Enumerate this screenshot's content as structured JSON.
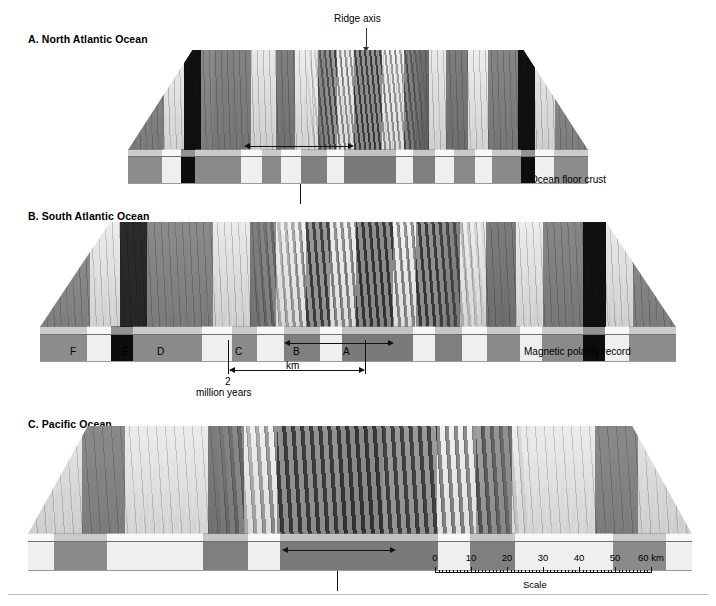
{
  "figure": {
    "ridge_axis_label": "Ridge axis",
    "ocean_floor_crust_label": "Ocean floor crust",
    "magnetic_polarity_label": "Magnetic polarity record",
    "km_label": "km",
    "million_years_number": "2",
    "million_years_label": "million years",
    "scale_caption": "Scale",
    "scale_unit_label": "60 km"
  },
  "panels": [
    {
      "id": "a",
      "title": "A. North Atlantic Ocean",
      "spreading": "slow",
      "top_stripes": [
        {
          "w": 26,
          "c": "#8a8a8a"
        },
        {
          "w": 14,
          "c": "#ececec"
        },
        {
          "w": 12,
          "c": "#111111"
        },
        {
          "w": 10,
          "c": "#8a8a8a"
        },
        {
          "w": 26,
          "c": "#838383"
        },
        {
          "w": 18,
          "c": "#e8e8e8"
        },
        {
          "w": 14,
          "c": "#7e7e7e"
        },
        {
          "w": 16,
          "c": "#ededed"
        },
        {
          "w": 14,
          "c": "#6f6f6f"
        },
        {
          "w": 12,
          "c": "#e5e5e5"
        },
        {
          "w": 20,
          "c": "#636363"
        },
        {
          "w": 16,
          "c": "#ebebeb"
        },
        {
          "w": 18,
          "c": "#6b6b6b"
        },
        {
          "w": 12,
          "c": "#e9e9e9"
        },
        {
          "w": 16,
          "c": "#7c7c7c"
        },
        {
          "w": 14,
          "c": "#ededed"
        },
        {
          "w": 22,
          "c": "#858585"
        },
        {
          "w": 12,
          "c": "#111111"
        },
        {
          "w": 14,
          "c": "#e9e9e9"
        },
        {
          "w": 24,
          "c": "#8d8d8d"
        }
      ],
      "crust_stripes": [
        {
          "w": 28,
          "c": "#8d8d8d"
        },
        {
          "w": 16,
          "c": "#efefef"
        },
        {
          "w": 12,
          "c": "#0d0d0d"
        },
        {
          "w": 38,
          "c": "#8a8a8a"
        },
        {
          "w": 18,
          "c": "#efefef"
        },
        {
          "w": 16,
          "c": "#8a8a8a"
        },
        {
          "w": 16,
          "c": "#efefef"
        },
        {
          "w": 22,
          "c": "#7f7f7f"
        },
        {
          "w": 14,
          "c": "#efefef"
        },
        {
          "w": 44,
          "c": "#7a7a7a"
        },
        {
          "w": 14,
          "c": "#efefef"
        },
        {
          "w": 18,
          "c": "#7f7f7f"
        },
        {
          "w": 16,
          "c": "#efefef"
        },
        {
          "w": 18,
          "c": "#8a8a8a"
        },
        {
          "w": 14,
          "c": "#efefef"
        },
        {
          "w": 24,
          "c": "#8a8a8a"
        },
        {
          "w": 12,
          "c": "#0d0d0d"
        },
        {
          "w": 16,
          "c": "#efefef"
        },
        {
          "w": 28,
          "c": "#8d8d8d"
        }
      ]
    },
    {
      "id": "b",
      "title": "B. South Atlantic Ocean",
      "spreading": "medium",
      "anomaly_labels": [
        "F",
        "E",
        "D",
        "C",
        "B",
        "A"
      ],
      "top_stripes": [
        {
          "w": 30,
          "c": "#909090"
        },
        {
          "w": 18,
          "c": "#ededed"
        },
        {
          "w": 16,
          "c": "#2b2b2b"
        },
        {
          "w": 40,
          "c": "#8b8b8b"
        },
        {
          "w": 22,
          "c": "#ebebeb"
        },
        {
          "w": 16,
          "c": "#7d7d7d"
        },
        {
          "w": 18,
          "c": "#ececec"
        },
        {
          "w": 14,
          "c": "#6e6e6e"
        },
        {
          "w": 16,
          "c": "#e8e8e8"
        },
        {
          "w": 22,
          "c": "#5f5f5f"
        },
        {
          "w": 14,
          "c": "#ebebeb"
        },
        {
          "w": 26,
          "c": "#666666"
        },
        {
          "w": 16,
          "c": "#ececec"
        },
        {
          "w": 18,
          "c": "#7c7c7c"
        },
        {
          "w": 16,
          "c": "#ededed"
        },
        {
          "w": 24,
          "c": "#878787"
        },
        {
          "w": 14,
          "c": "#111111"
        },
        {
          "w": 16,
          "c": "#ebebeb"
        },
        {
          "w": 26,
          "c": "#8d8d8d"
        }
      ],
      "crust_stripes": [
        {
          "w": 34,
          "c": "#8d8d8d"
        },
        {
          "w": 18,
          "c": "#efefef"
        },
        {
          "w": 16,
          "c": "#0d0d0d"
        },
        {
          "w": 50,
          "c": "#8a8a8a"
        },
        {
          "w": 22,
          "c": "#efefef"
        },
        {
          "w": 18,
          "c": "#8a8a8a"
        },
        {
          "w": 20,
          "c": "#efefef"
        },
        {
          "w": 26,
          "c": "#7f7f7f"
        },
        {
          "w": 16,
          "c": "#efefef"
        },
        {
          "w": 52,
          "c": "#7a7a7a"
        },
        {
          "w": 16,
          "c": "#efefef"
        },
        {
          "w": 20,
          "c": "#7f7f7f"
        },
        {
          "w": 18,
          "c": "#efefef"
        },
        {
          "w": 24,
          "c": "#8a8a8a"
        },
        {
          "w": 16,
          "c": "#efefef"
        },
        {
          "w": 30,
          "c": "#8a8a8a"
        },
        {
          "w": 16,
          "c": "#0d0d0d"
        },
        {
          "w": 18,
          "c": "#efefef"
        },
        {
          "w": 34,
          "c": "#8d8d8d"
        }
      ]
    },
    {
      "id": "c",
      "title": "C. Pacific Ocean",
      "spreading": "fast",
      "top_stripes": [
        {
          "w": 50,
          "c": "#e6e6e6"
        },
        {
          "w": 40,
          "c": "#8a8a8a"
        },
        {
          "w": 76,
          "c": "#ededed"
        },
        {
          "w": 34,
          "c": "#7d7d7d"
        },
        {
          "w": 30,
          "c": "#ececec"
        },
        {
          "w": 58,
          "c": "#6a6a6a"
        },
        {
          "w": 40,
          "c": "#5f5f5f"
        },
        {
          "w": 50,
          "c": "#747474"
        },
        {
          "w": 36,
          "c": "#ebebeb"
        },
        {
          "w": 34,
          "c": "#848484"
        },
        {
          "w": 76,
          "c": "#ededed"
        },
        {
          "w": 40,
          "c": "#8a8a8a"
        },
        {
          "w": 50,
          "c": "#e6e6e6"
        }
      ],
      "crust_stripes": [
        {
          "w": 24,
          "c": "#efefef"
        },
        {
          "w": 50,
          "c": "#8a8a8a"
        },
        {
          "w": 90,
          "c": "#efefef"
        },
        {
          "w": 42,
          "c": "#7f7f7f"
        },
        {
          "w": 30,
          "c": "#efefef"
        },
        {
          "w": 148,
          "c": "#7a7a7a"
        },
        {
          "w": 30,
          "c": "#efefef"
        },
        {
          "w": 42,
          "c": "#7f7f7f"
        },
        {
          "w": 92,
          "c": "#efefef"
        },
        {
          "w": 50,
          "c": "#8a8a8a"
        },
        {
          "w": 24,
          "c": "#efefef"
        }
      ]
    }
  ],
  "scale": {
    "ticks": [
      "0",
      "10",
      "20",
      "30",
      "40",
      "50",
      "60 km"
    ],
    "min": 0,
    "max": 60,
    "unit": "km"
  }
}
